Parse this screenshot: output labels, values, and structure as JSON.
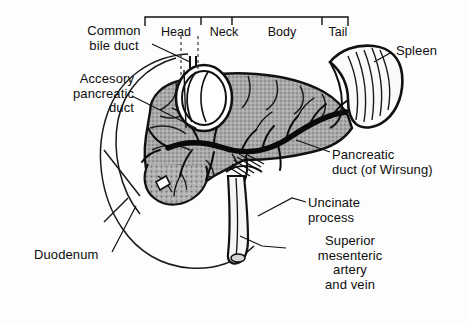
{
  "figure": {
    "background_color": "#fdfdfd",
    "ink_color": "#111111",
    "parenchyma_color": "#9c9c9c"
  },
  "regions": {
    "bracket_label": "Head Neck Body Tail",
    "items": [
      {
        "label": "Head"
      },
      {
        "label": "Neck"
      },
      {
        "label": "Body"
      },
      {
        "label": "Tail"
      }
    ]
  },
  "labels": {
    "common_bile_duct": "Common\nbile duct",
    "accesory_pancreatic_duct": "Accesory\npancreatic\nduct",
    "duodenum": "Duodenum",
    "spleen": "Spleen",
    "pancreatic_duct": "Pancreatic\nduct (of Wirsung)",
    "uncinate_process": "Uncinate\nprocess",
    "superior_mesenteric": "Superior\nmesenteric\nartery\nand vein"
  },
  "structures": [
    {
      "name": "pancreas-head",
      "icon": "organ-icon"
    },
    {
      "name": "pancreas-neck",
      "icon": "organ-icon"
    },
    {
      "name": "pancreas-body",
      "icon": "organ-icon"
    },
    {
      "name": "pancreas-tail",
      "icon": "organ-icon"
    },
    {
      "name": "spleen",
      "icon": "organ-icon"
    },
    {
      "name": "duodenum",
      "icon": "outline-icon"
    },
    {
      "name": "common-bile-duct",
      "icon": "duct-icon"
    },
    {
      "name": "accesory-pancreatic-duct",
      "icon": "duct-icon"
    },
    {
      "name": "pancreatic-duct",
      "icon": "duct-icon"
    },
    {
      "name": "superior-mesenteric-vessels",
      "icon": "vessel-icon"
    },
    {
      "name": "uncinate-process",
      "icon": "organ-icon"
    }
  ]
}
